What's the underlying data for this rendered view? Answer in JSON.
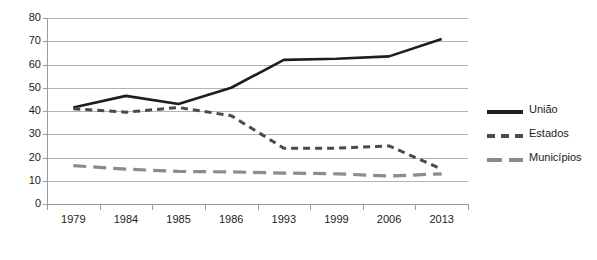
{
  "chart_data": {
    "type": "line",
    "title": "",
    "subtitle": "",
    "xlabel": "",
    "ylabel": "",
    "categories": [
      "1979",
      "1984",
      "1985",
      "1986",
      "1993",
      "1999",
      "2006",
      "2013"
    ],
    "ylim": [
      0,
      80
    ],
    "ytick_values": [
      0,
      10,
      20,
      30,
      40,
      50,
      60,
      70,
      80
    ],
    "ytick_labels": [
      "0",
      "10",
      "20",
      "30",
      "40",
      "50",
      "60",
      "70",
      "80"
    ],
    "grid": true,
    "grid_axis": "y",
    "legend_position": "right",
    "series": [
      {
        "name": "União",
        "style": "solid",
        "color": "#1e1e1e",
        "values": [
          41.5,
          46.5,
          43.0,
          50.0,
          62.0,
          62.5,
          63.5,
          71.0
        ]
      },
      {
        "name": "Estados",
        "style": "dashed-short",
        "color": "#4a4a4a",
        "values": [
          41.0,
          39.5,
          41.5,
          38.0,
          24.0,
          24.0,
          25.0,
          15.0
        ]
      },
      {
        "name": "Municípios",
        "style": "dashed-long",
        "color": "#8c8c8c",
        "values": [
          16.5,
          15.0,
          14.0,
          13.8,
          13.3,
          13.0,
          12.0,
          13.0
        ]
      }
    ]
  },
  "legend": {
    "items": [
      {
        "label": "União",
        "swatch": "solid-line-swatch"
      },
      {
        "label": "Estados",
        "swatch": "short-dashed-line-swatch"
      },
      {
        "label": "Municípios",
        "swatch": "long-dashed-line-swatch"
      }
    ]
  },
  "colors": {
    "uniao": "#1e1e1e",
    "estados": "#4a4a4a",
    "municipios": "#8c8c8c",
    "gridline": "#b4b4b4",
    "axis": "#9a9a9a",
    "text": "#1b1b1b",
    "background": "#ffffff"
  }
}
